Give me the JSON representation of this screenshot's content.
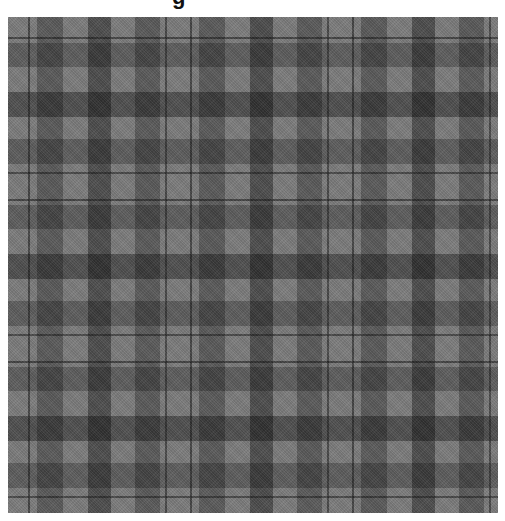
{
  "image": {
    "subject": "gray plaid tartan fabric swatch",
    "caption_fragment": "g",
    "colors": {
      "background": "#ffffff",
      "fabric_light": "#8a8a8a",
      "fabric_mid": "#6a6a6a",
      "fabric_dark": "#2e2e2e",
      "pinstripe": "#141414"
    }
  }
}
